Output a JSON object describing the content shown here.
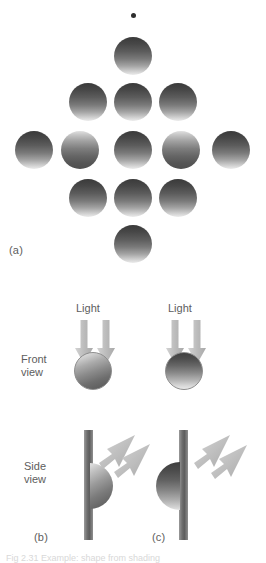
{
  "figure": {
    "background_color": "#ffffff",
    "ink_color": "#5d5d5d",
    "panels": [
      {
        "id": "a",
        "label": "(a)"
      },
      {
        "id": "b",
        "label": "(b)"
      },
      {
        "id": "c",
        "label": "(c)"
      }
    ]
  },
  "panel_a": {
    "label": "(a)",
    "description": "Diamond array of shaded spheres with a small fixation dot above",
    "fixation_dot": {
      "cx": 133,
      "cy": 15,
      "r": 2.5,
      "color": "#2e2e2e"
    },
    "sphere_diameter": 38,
    "spheres": [
      {
        "id": "s-top",
        "cx": 133,
        "cy": 56,
        "shading": "dark-top"
      },
      {
        "id": "s-r2-left",
        "cx": 88,
        "cy": 102,
        "shading": "dark-top"
      },
      {
        "id": "s-r2-center",
        "cx": 133,
        "cy": 102,
        "shading": "dark-top"
      },
      {
        "id": "s-r2-right",
        "cx": 178,
        "cy": 102,
        "shading": "dark-top"
      },
      {
        "id": "s-r3-far-left",
        "cx": 34,
        "cy": 150,
        "shading": "dark-top"
      },
      {
        "id": "s-r3-left",
        "cx": 80,
        "cy": 150,
        "shading": "light-top"
      },
      {
        "id": "s-r3-center",
        "cx": 133,
        "cy": 150,
        "shading": "dark-top"
      },
      {
        "id": "s-r3-right",
        "cx": 181,
        "cy": 150,
        "shading": "light-top"
      },
      {
        "id": "s-r3-far-right",
        "cx": 231,
        "cy": 150,
        "shading": "dark-top"
      },
      {
        "id": "s-r4-left",
        "cx": 88,
        "cy": 198,
        "shading": "dark-top"
      },
      {
        "id": "s-r4-center",
        "cx": 133,
        "cy": 198,
        "shading": "dark-top"
      },
      {
        "id": "s-r4-right",
        "cx": 178,
        "cy": 198,
        "shading": "dark-top"
      },
      {
        "id": "s-bottom",
        "cx": 133,
        "cy": 244,
        "shading": "dark-top"
      }
    ]
  },
  "panel_b": {
    "label": "(b)",
    "light_label": "Light",
    "front_view_label_line1": "Front",
    "front_view_label_line2": "view",
    "side_view_label_line1": "Side",
    "side_view_label_line2": "view",
    "front_shape": "convex",
    "side_shape": "bump"
  },
  "panel_c": {
    "label": "(c)",
    "light_label": "Light",
    "front_shape": "concave",
    "side_shape": "dimple"
  },
  "caption": {
    "partial_text": "Fig 2.31  Example: shape from shading"
  }
}
